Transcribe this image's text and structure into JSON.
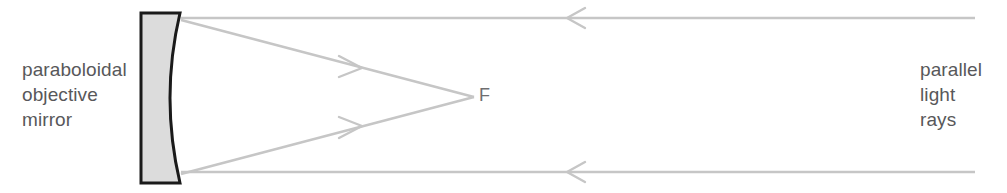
{
  "diagram": {
    "background_color": "#ffffff",
    "width": 1007,
    "height": 193
  },
  "labels": {
    "mirror_label": "paraboloidal\nobjective\nmirror",
    "mirror_label_lines": [
      "paraboloidal",
      "objective",
      "mirror"
    ],
    "rays_label": "parallel\nlight\nrays",
    "rays_label_lines": [
      "parallel",
      "light",
      "rays"
    ],
    "focus_label": "F",
    "text_color": "#58585a"
  },
  "mirror": {
    "name": "paraboloidal objective mirror",
    "fill_color": "#dcdcdc",
    "outline_color": "#1a1a1a",
    "outline_width": 3,
    "back_edge_x": 141,
    "top_y": 13,
    "bottom_y": 183,
    "rim_x": 180,
    "vertex_x": 163,
    "vertex_y": 98
  },
  "rays": {
    "color": "#c6c6c6",
    "stroke_width": 2.4,
    "focal_point": {
      "x": 474,
      "y": 97
    },
    "incoming": [
      {
        "name": "upper-parallel-ray",
        "from_x": 975,
        "from_y": 18,
        "to_x": 181,
        "to_y": 18,
        "arrow_x": 572,
        "arrow_y": 18,
        "arrow_direction": "left"
      },
      {
        "name": "lower-parallel-ray",
        "from_x": 975,
        "from_y": 172,
        "to_x": 181,
        "to_y": 172,
        "arrow_x": 572,
        "arrow_y": 172,
        "arrow_direction": "left"
      }
    ],
    "reflected": [
      {
        "name": "upper-reflected-ray",
        "from_x": 181,
        "from_y": 20,
        "to_x": 474,
        "to_y": 97,
        "arrow_x": 356,
        "arrow_y": 66,
        "arrow_direction": "down-right"
      },
      {
        "name": "lower-reflected-ray",
        "from_x": 181,
        "from_y": 174,
        "to_x": 474,
        "to_y": 97,
        "arrow_x": 356,
        "arrow_y": 128,
        "arrow_direction": "up-right"
      }
    ]
  }
}
